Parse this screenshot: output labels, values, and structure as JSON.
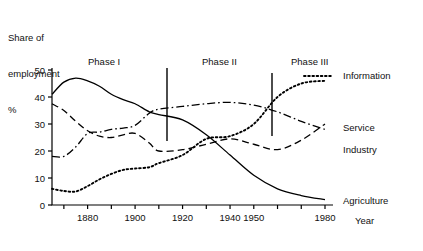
{
  "axis_title": {
    "text": "Share of\nemployment\n%",
    "line1": "Share of",
    "line2": "employment",
    "line3": "%"
  },
  "xaxis_title": "Year",
  "phases": [
    {
      "label": "Phase I",
      "x_px": 88,
      "y_px": 56
    },
    {
      "label": "Phase II",
      "x_px": 202,
      "y_px": 56
    },
    {
      "label": "Phase III",
      "x_px": 291,
      "y_px": 56
    }
  ],
  "phase_dividers": [
    {
      "x_px": 167,
      "y_top_px": 68,
      "y_bottom_px": 141,
      "year": 1906
    },
    {
      "x_px": 272,
      "y_top_px": 73,
      "y_bottom_px": 136,
      "year": 1955
    }
  ],
  "legend": [
    {
      "name": "Information",
      "style": "dotted",
      "x_px": 343,
      "y_px": 76
    },
    {
      "name": "Service",
      "style": "dashdot",
      "x_px": 343,
      "y_px": 128
    },
    {
      "name": "Industry",
      "style": "dashed",
      "x_px": 343,
      "y_px": 150
    },
    {
      "name": "Agriculture",
      "style": "solid",
      "x_px": 343,
      "y_px": 201
    }
  ],
  "chart_data": {
    "type": "line",
    "title": "",
    "xlabel": "Year",
    "ylabel": "Share of employment %",
    "xlim": [
      1865,
      1980
    ],
    "ylim": [
      0,
      50
    ],
    "yticks": [
      0,
      10,
      20,
      30,
      40,
      50
    ],
    "xticks": [
      1870,
      1880,
      1890,
      1900,
      1910,
      1920,
      1930,
      1940,
      1950,
      1960,
      1970,
      1980
    ],
    "xtick_labels": [
      "",
      "1880",
      "",
      "1900",
      "",
      "1920",
      "",
      "1940",
      "1950",
      "",
      "",
      "1980"
    ],
    "grid": false,
    "legend_position": "right",
    "annotations": [
      "Phase I",
      "Phase II",
      "Phase III"
    ],
    "series": [
      {
        "name": "Agriculture",
        "style": "solid",
        "x": [
          1865,
          1870,
          1875,
          1880,
          1885,
          1890,
          1895,
          1900,
          1906,
          1910,
          1920,
          1930,
          1940,
          1950,
          1960,
          1970,
          1980
        ],
        "values": [
          41.0,
          45.5,
          47.0,
          46.0,
          44.0,
          41.0,
          39.0,
          37.5,
          34.5,
          33.5,
          31.5,
          26.0,
          18.5,
          11.0,
          6.0,
          3.5,
          2.0
        ]
      },
      {
        "name": "Industry",
        "style": "dashed",
        "x": [
          1865,
          1870,
          1875,
          1880,
          1885,
          1890,
          1895,
          1900,
          1906,
          1910,
          1920,
          1930,
          1940,
          1950,
          1960,
          1970,
          1980
        ],
        "values": [
          37.5,
          35.0,
          31.0,
          27.5,
          25.5,
          25.0,
          26.0,
          26.5,
          23.0,
          20.0,
          20.5,
          22.5,
          24.5,
          22.5,
          20.5,
          24.0,
          30.0
        ]
      },
      {
        "name": "Service",
        "style": "dashdot",
        "x": [
          1865,
          1870,
          1875,
          1880,
          1885,
          1890,
          1895,
          1900,
          1906,
          1910,
          1920,
          1930,
          1940,
          1950,
          1960,
          1970,
          1980
        ],
        "values": [
          18.0,
          18.0,
          21.5,
          26.5,
          27.0,
          28.0,
          28.5,
          29.5,
          34.0,
          35.5,
          36.5,
          37.5,
          38.0,
          37.0,
          34.5,
          31.0,
          28.0
        ]
      },
      {
        "name": "Information",
        "style": "dotted",
        "x": [
          1865,
          1870,
          1875,
          1880,
          1885,
          1890,
          1895,
          1900,
          1906,
          1910,
          1920,
          1930,
          1940,
          1950,
          1960,
          1970,
          1980
        ],
        "values": [
          6.0,
          5.2,
          5.0,
          7.0,
          9.5,
          11.5,
          13.0,
          13.5,
          14.0,
          15.5,
          18.5,
          24.5,
          25.5,
          30.0,
          40.0,
          45.0,
          46.0
        ]
      }
    ]
  }
}
